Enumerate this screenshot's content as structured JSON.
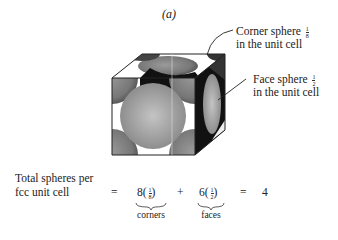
{
  "figure": {
    "label": "(a)",
    "callouts": [
      {
        "text_line1": "Corner sphere",
        "fraction": {
          "num": "1",
          "den": "8"
        },
        "text_line2": "in the unit cell"
      },
      {
        "text_line1": "Face sphere",
        "fraction": {
          "num": "1",
          "den": "2"
        },
        "text_line2": "in the unit cell"
      }
    ],
    "equation": {
      "lhs_line1": "Total spheres per",
      "lhs_line2": "fcc unit cell",
      "equals": "=",
      "term1": "8(1/8)",
      "term1_coef": "8",
      "term1_label": "corners",
      "plus": "+",
      "term2": "6(1/2)",
      "term2_coef": "6",
      "term2_label": "faces",
      "equals2": "=",
      "result": "4"
    }
  }
}
